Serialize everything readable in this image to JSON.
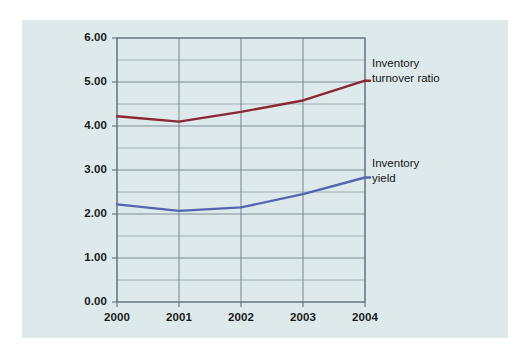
{
  "chart_data": {
    "type": "line",
    "title": "",
    "subtitle": "",
    "xlabel": "",
    "ylabel": "",
    "categories": [
      "2000",
      "2001",
      "2002",
      "2003",
      "2004"
    ],
    "x": [
      2000,
      2001,
      2002,
      2003,
      2004
    ],
    "xlim": [
      2000,
      2004
    ],
    "ylim": [
      0.0,
      6.0
    ],
    "y_major_step": 1.0,
    "y_minor_step": 0.5,
    "grid": "horizontal-and-vertical",
    "legend_position": "inline-right-of-line-end",
    "y_tick_labels": [
      "0.00",
      "1.00",
      "2.00",
      "3.00",
      "4.00",
      "5.00",
      "6.00"
    ],
    "x_tick_labels": [
      "2000",
      "2001",
      "2002",
      "2003",
      "2004"
    ],
    "series": [
      {
        "name": "Inventory turnover ratio",
        "label_line1": "Inventory",
        "label_line2": "turnover ratio",
        "color": "#8B2635",
        "values": [
          4.22,
          4.1,
          4.32,
          4.58,
          5.03
        ]
      },
      {
        "name": "Inventory yield",
        "label_line1": "Inventory",
        "label_line2": "yield",
        "color": "#5566B0",
        "values": [
          2.22,
          2.07,
          2.15,
          2.45,
          2.83
        ]
      }
    ]
  },
  "colors": {
    "page_background": "#ffffff",
    "panel_background": "#dde9eb",
    "grid_line": "#8795a0",
    "axis_line": "#5f6f7a",
    "turnover_ratio": "#8B2635",
    "inventory_yield": "#5566B0",
    "text": "#1a1a1a"
  },
  "annotations": {
    "turnover": {
      "line1": "Inventory",
      "line2": "turnover ratio"
    },
    "yield": {
      "line1": "Inventory",
      "line2": "yield"
    }
  }
}
